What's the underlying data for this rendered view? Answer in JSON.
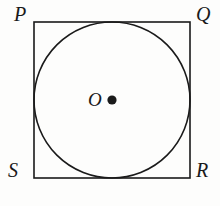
{
  "figure": {
    "type": "geometry-diagram",
    "background_color": "#fdfdfc",
    "stroke_color": "#1a1a1a",
    "square": {
      "name": "PQRS",
      "x": 34,
      "y": 22,
      "width": 156,
      "height": 156,
      "stroke_width": 1.6
    },
    "circle": {
      "center_x": 112,
      "center_y": 100,
      "radius": 78,
      "stroke_width": 1.6,
      "inscribed": true
    },
    "center_dot": {
      "center_x": 112,
      "center_y": 100,
      "radius": 4.6,
      "fill": "#1a1a1a"
    },
    "labels": {
      "top_left": "P",
      "top_right": "Q",
      "bottom_right": "R",
      "bottom_left": "S",
      "center": "O"
    }
  }
}
